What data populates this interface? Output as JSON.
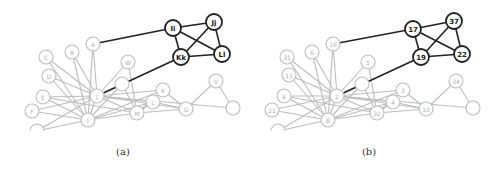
{
  "figure": {
    "panels": [
      {
        "id": "a",
        "caption": "(a)",
        "highlight_nodes": [
          {
            "key": "n1",
            "label": "Ii",
            "x": 173,
            "y": 28
          },
          {
            "key": "n2",
            "label": "Jj",
            "x": 214,
            "y": 22
          },
          {
            "key": "n3",
            "label": "Kk",
            "x": 181,
            "y": 57
          },
          {
            "key": "n4",
            "label": "Ll",
            "x": 222,
            "y": 54
          }
        ],
        "background_nodes": [
          {
            "key": "a",
            "label": "A",
            "x": 93,
            "y": 44
          },
          {
            "key": "b",
            "label": "B",
            "x": 72,
            "y": 52
          },
          {
            "key": "c",
            "label": "C",
            "x": 46,
            "y": 57
          },
          {
            "key": "d",
            "label": "D",
            "x": 49,
            "y": 76
          },
          {
            "key": "w",
            "label": "W",
            "x": 128,
            "y": 62
          },
          {
            "key": "u",
            "label": "",
            "x": 122,
            "y": 84
          },
          {
            "key": "e",
            "label": "E",
            "x": 43,
            "y": 97
          },
          {
            "key": "f",
            "label": "F",
            "x": 32,
            "y": 111
          },
          {
            "key": "j",
            "label": "J",
            "x": 97,
            "y": 96
          },
          {
            "key": "i",
            "label": "I",
            "x": 88,
            "y": 120
          },
          {
            "key": "k",
            "label": "K",
            "x": 163,
            "y": 90
          },
          {
            "key": "l",
            "label": "L",
            "x": 153,
            "y": 102
          },
          {
            "key": "m",
            "label": "M",
            "x": 137,
            "y": 113
          },
          {
            "key": "o",
            "label": "O",
            "x": 186,
            "y": 109
          },
          {
            "key": "v",
            "label": "V",
            "x": 216,
            "y": 81
          },
          {
            "key": "r",
            "label": "",
            "x": 233,
            "y": 108
          },
          {
            "key": "g",
            "label": "",
            "x": 37,
            "y": 131
          }
        ]
      },
      {
        "id": "b",
        "caption": "(b)",
        "highlight_nodes": [
          {
            "key": "n1",
            "label": "17",
            "x": 167,
            "y": 29
          },
          {
            "key": "n2",
            "label": "37",
            "x": 208,
            "y": 21
          },
          {
            "key": "n3",
            "label": "19",
            "x": 175,
            "y": 57
          },
          {
            "key": "n4",
            "label": "22",
            "x": 216,
            "y": 54
          }
        ],
        "background_nodes": [
          {
            "key": "a",
            "label": "16",
            "x": 87,
            "y": 44
          },
          {
            "key": "b",
            "label": "6",
            "x": 66,
            "y": 52
          },
          {
            "key": "c",
            "label": "31",
            "x": 41,
            "y": 57
          },
          {
            "key": "d",
            "label": "11",
            "x": 43,
            "y": 75
          },
          {
            "key": "w",
            "label": "5",
            "x": 122,
            "y": 62
          },
          {
            "key": "u",
            "label": "",
            "x": 116,
            "y": 84
          },
          {
            "key": "e",
            "label": "9",
            "x": 38,
            "y": 96
          },
          {
            "key": "f",
            "label": "21",
            "x": 26,
            "y": 110
          },
          {
            "key": "j",
            "label": "2",
            "x": 91,
            "y": 96
          },
          {
            "key": "i",
            "label": "8",
            "x": 82,
            "y": 120
          },
          {
            "key": "k",
            "label": "3",
            "x": 157,
            "y": 90
          },
          {
            "key": "l",
            "label": "4",
            "x": 147,
            "y": 102
          },
          {
            "key": "m",
            "label": "32",
            "x": 131,
            "y": 113
          },
          {
            "key": "o",
            "label": "10",
            "x": 180,
            "y": 109
          },
          {
            "key": "v",
            "label": "34",
            "x": 210,
            "y": 81
          },
          {
            "key": "r",
            "label": "",
            "x": 227,
            "y": 108
          },
          {
            "key": "g",
            "label": "",
            "x": 32,
            "y": 131
          }
        ]
      }
    ],
    "highlight_edges": [
      [
        "n1",
        "n2"
      ],
      [
        "n1",
        "n3"
      ],
      [
        "n1",
        "n4"
      ],
      [
        "n2",
        "n3"
      ],
      [
        "n2",
        "n4"
      ],
      [
        "n3",
        "n4"
      ],
      [
        "n1",
        "a"
      ],
      [
        "n3",
        "j"
      ]
    ],
    "background_edges": [
      [
        "a",
        "j"
      ],
      [
        "a",
        "i"
      ],
      [
        "b",
        "j"
      ],
      [
        "b",
        "i"
      ],
      [
        "c",
        "j"
      ],
      [
        "c",
        "i"
      ],
      [
        "d",
        "j"
      ],
      [
        "d",
        "i"
      ],
      [
        "w",
        "j"
      ],
      [
        "w",
        "m"
      ],
      [
        "u",
        "j"
      ],
      [
        "u",
        "m"
      ],
      [
        "e",
        "j"
      ],
      [
        "e",
        "i"
      ],
      [
        "e",
        "m"
      ],
      [
        "f",
        "j"
      ],
      [
        "f",
        "i"
      ],
      [
        "j",
        "i"
      ],
      [
        "j",
        "k"
      ],
      [
        "j",
        "l"
      ],
      [
        "j",
        "m"
      ],
      [
        "j",
        "o"
      ],
      [
        "i",
        "m"
      ],
      [
        "i",
        "l"
      ],
      [
        "i",
        "k"
      ],
      [
        "k",
        "o"
      ],
      [
        "l",
        "o"
      ],
      [
        "m",
        "o"
      ],
      [
        "v",
        "o"
      ],
      [
        "v",
        "r"
      ],
      [
        "k",
        "m"
      ],
      [
        "l",
        "m"
      ],
      [
        "g",
        "j"
      ],
      [
        "g",
        "i"
      ],
      [
        "i",
        "u"
      ],
      [
        "j",
        "r"
      ]
    ]
  }
}
